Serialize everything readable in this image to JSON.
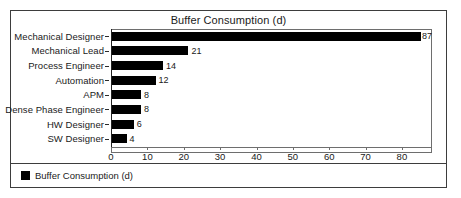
{
  "chart_data": {
    "type": "bar",
    "orientation": "horizontal",
    "title": "Buffer Consumption (d)",
    "xlabel": "",
    "ylabel": "",
    "categories": [
      "Mechanical Designer",
      "Mechanical Lead",
      "Process Engineer",
      "Automation",
      "APM",
      "Dense Phase Engineer",
      "HW Designer",
      "SW Designer"
    ],
    "values": [
      87,
      21,
      14,
      12,
      8,
      8,
      6,
      4
    ],
    "value_labels": [
      "87",
      "21",
      "14",
      "12",
      "8",
      "8",
      "6",
      "4"
    ],
    "series": [
      {
        "name": "Buffer Consumption (d)",
        "color": "#000000",
        "values": [
          87,
          21,
          14,
          12,
          8,
          8,
          6,
          4
        ]
      }
    ],
    "xlim": [
      0,
      88
    ],
    "xticks": [
      0,
      10,
      20,
      30,
      40,
      50,
      60,
      70,
      80
    ],
    "xtick_labels": [
      "0",
      "10",
      "20",
      "30",
      "40",
      "50",
      "60",
      "70",
      "80"
    ],
    "grid": false,
    "legend": {
      "position": "bottom-left",
      "entries": [
        {
          "label": "Buffer Consumption (d)",
          "color": "#000000",
          "marker": "square"
        }
      ]
    }
  },
  "colors": {
    "bar": "#000000",
    "frame": "#3d3d3d",
    "plot_border": "#6e6e6e",
    "axis": "#222222",
    "background": "#ffffff",
    "text": "#1a1a1a"
  }
}
